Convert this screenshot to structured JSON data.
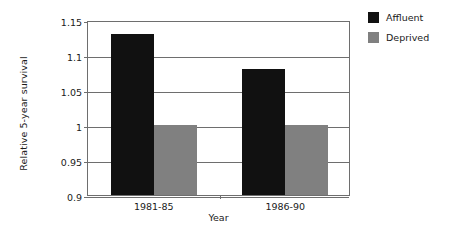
{
  "chart_data": {
    "type": "bar",
    "title": "",
    "xlabel": "Year",
    "ylabel": "Relative 5-year survival",
    "categories": [
      "1981-85",
      "1986-90"
    ],
    "series": [
      {
        "name": "Affluent",
        "color": "#111111",
        "values": [
          1.13,
          1.0
        ]
      },
      {
        "name": "Deprived",
        "color": "#808080",
        "values": [
          1.0,
          1.0
        ]
      }
    ],
    "ylim": [
      0.9,
      1.15
    ],
    "ytick_values": [
      0.9,
      0.95,
      1.0,
      1.05,
      1.1,
      1.15
    ],
    "ytick_labels": [
      "0.9",
      "0.95",
      "1",
      "1.05",
      "1.1",
      "1.15"
    ],
    "grid": true,
    "legend_position": "top-right-outside"
  },
  "axes": {
    "y_title": "Relative 5-year survival",
    "x_title": "Year",
    "y_ticks": [
      {
        "label": "1.15",
        "value": 1.15
      },
      {
        "label": "1.1",
        "value": 1.1
      },
      {
        "label": "1.05",
        "value": 1.05
      },
      {
        "label": "1",
        "value": 1.0
      },
      {
        "label": "0.95",
        "value": 0.95
      },
      {
        "label": "0.9",
        "value": 0.9
      }
    ],
    "x_ticks": [
      {
        "label": "1981-85"
      },
      {
        "label": "1986-90"
      }
    ]
  },
  "bars": [
    {
      "group": "1981-85",
      "series": "Affluent",
      "value": 1.13
    },
    {
      "group": "1981-85",
      "series": "Deprived",
      "value": 1.0
    },
    {
      "group": "1986-90",
      "series": "Affluent",
      "value": 1.08
    },
    {
      "group": "1986-90",
      "series": "Deprived",
      "value": 1.0
    }
  ],
  "legend": {
    "items": [
      {
        "label": "Affluent",
        "color": "#111111"
      },
      {
        "label": "Deprived",
        "color": "#808080"
      }
    ]
  }
}
